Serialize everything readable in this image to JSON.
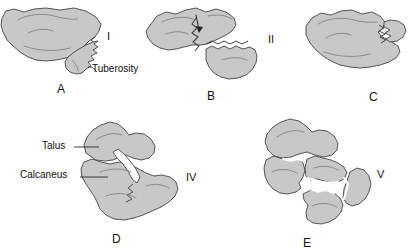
{
  "figure": {
    "bone_fill": "#c8c8c8",
    "bone_stroke": "#444444",
    "detail_stroke": "#6e6e6e",
    "background": "#ffffff",
    "text_color": "#111111"
  },
  "panels": [
    {
      "id": "A",
      "letter": "A",
      "roman": "I",
      "description": "Tuberosity fragment separated from calcaneal body by jagged fracture line",
      "letter_pos": {
        "x": 57,
        "y": 88
      },
      "roman_pos": {
        "x": 107,
        "y": 32
      }
    },
    {
      "id": "B",
      "letter": "B",
      "roman": "II",
      "description": "Two-part fracture with displaced posterior fragment and arrow marking fracture line",
      "letter_pos": {
        "x": 207,
        "y": 95
      },
      "roman_pos": {
        "x": 268,
        "y": 35
      }
    },
    {
      "id": "C",
      "letter": "C",
      "roman": "",
      "description": "Calcaneus with small posterior cortical fracture",
      "letter_pos": {
        "x": 369,
        "y": 96
      },
      "roman_pos": {
        "x": 0,
        "y": 0
      }
    },
    {
      "id": "D",
      "letter": "D",
      "roman": "IV",
      "description": "Talus and calcaneus with intra-articular fracture extending through posterior facet",
      "letter_pos": {
        "x": 112,
        "y": 239
      },
      "roman_pos": {
        "x": 186,
        "y": 180
      }
    },
    {
      "id": "E",
      "letter": "E",
      "roman": "V",
      "description": "Comminuted calcaneal fracture with multiple displaced fragments beneath talus",
      "letter_pos": {
        "x": 303,
        "y": 243
      },
      "roman_pos": {
        "x": 377,
        "y": 177
      }
    }
  ],
  "annotations": [
    {
      "id": "tuberosity",
      "label": "Tuberosity",
      "panel": "A",
      "label_pos": {
        "x": 92,
        "y": 70
      },
      "leader": "curved"
    },
    {
      "id": "talus",
      "label": "Talus",
      "panel": "D",
      "label_pos": {
        "x": 42,
        "y": 147
      },
      "leader": "horizontal"
    },
    {
      "id": "calcaneus",
      "label": "Calcaneus",
      "panel": "D",
      "label_pos": {
        "x": 20,
        "y": 176
      },
      "leader": "horizontal"
    }
  ]
}
